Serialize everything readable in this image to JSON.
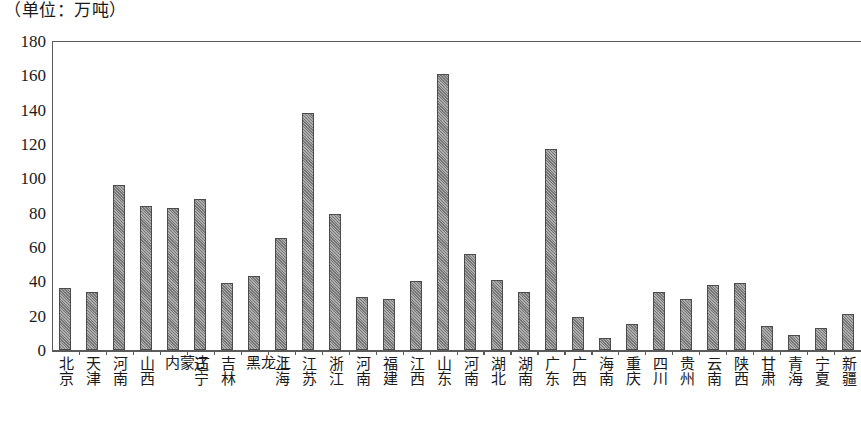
{
  "chart_data": {
    "type": "bar",
    "title": "（单位：万吨）",
    "xlabel": "",
    "ylabel": "",
    "unit_note": "（单位：万吨）",
    "ylim": [
      0,
      180
    ],
    "yticks": [
      0,
      20,
      40,
      60,
      80,
      100,
      120,
      140,
      160,
      180
    ],
    "ytick_labels": [
      "0",
      "20",
      "40",
      "60",
      "80",
      "100",
      "120",
      "140",
      "160",
      "180"
    ],
    "grid": false,
    "legend": null,
    "bar_color": "#8a8a8a",
    "bar_edge_color": "#4c4c4c",
    "axis_color": "#5a5a5a",
    "categories": [
      "北京",
      "天津",
      "河南",
      "山西",
      "内蒙古",
      "辽宁",
      "吉林",
      "黑龙江",
      "上海",
      "江苏",
      "浙江",
      "河南",
      "福建",
      "江西",
      "山东",
      "河南",
      "湖北",
      "湖南",
      "广东",
      "广西",
      "海南",
      "重庆",
      "四川",
      "贵州",
      "云南",
      "陕西",
      "甘肃",
      "青海",
      "宁夏",
      "新疆"
    ],
    "values": [
      36,
      34,
      96,
      84,
      83,
      88,
      39,
      43,
      65,
      138,
      79,
      31,
      30,
      40,
      161,
      56,
      41,
      34,
      117,
      19,
      7,
      15,
      34,
      30,
      38,
      39,
      14,
      9,
      13,
      21
    ]
  }
}
